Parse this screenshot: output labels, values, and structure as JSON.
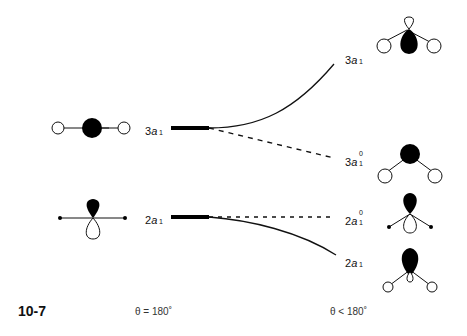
{
  "figure": {
    "number": "10-7",
    "caption_left": "θ = 180˚",
    "caption_right": "θ < 180˚"
  },
  "levels_left": [
    {
      "id": "3a1-linear",
      "num": "3",
      "sym": "a",
      "sub": "1",
      "sup": "",
      "y": 128
    },
    {
      "id": "2a1-linear",
      "num": "2",
      "sym": "a",
      "sub": "1",
      "sup": "",
      "y": 217
    }
  ],
  "levels_right": [
    {
      "id": "3a1-bent",
      "num": "3",
      "sym": "a",
      "sub": "1",
      "sup": "",
      "y": 40,
      "connector": "solid"
    },
    {
      "id": "3a1-zero-bent",
      "num": "3",
      "sym": "a",
      "sub": "1",
      "sup": "0",
      "y": 158,
      "connector": "dashed"
    },
    {
      "id": "2a1-zero-bent",
      "num": "2",
      "sym": "a",
      "sub": "1",
      "sup": "0",
      "y": 217,
      "connector": "dashed"
    },
    {
      "id": "2a1-bent",
      "num": "2",
      "sym": "a",
      "sub": "1",
      "sup": "",
      "y": 258,
      "connector": "solid"
    }
  ],
  "colors": {
    "line": "#111111",
    "lobe_fill": "#000000",
    "open_fill": "#ffffff"
  }
}
